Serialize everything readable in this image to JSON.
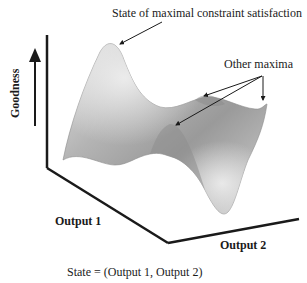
{
  "labels": {
    "global_max": "State of maximal constraint satisfaction",
    "other_maxima": "Other maxima",
    "y_axis": "Goodness",
    "x_axis_1": "Output 1",
    "x_axis_2": "Output 2",
    "caption": "State = (Output 1, Output 2)"
  },
  "colors": {
    "axis": "#1a1a1a",
    "surface_light": "#d8d8d8",
    "surface_mid": "#a8a8a8",
    "surface_dark": "#8a8a8a"
  }
}
